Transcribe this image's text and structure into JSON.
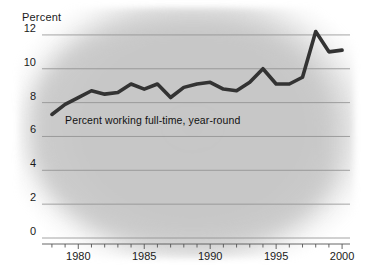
{
  "chart_data": {
    "type": "line",
    "title": "",
    "ylabel": "Percent",
    "xlabel": "",
    "ylim": [
      0,
      13
    ],
    "xlim": [
      1977.4,
      2000.6
    ],
    "grid": true,
    "legend_position": "inline-annotation",
    "annotations": [
      {
        "text": "Percent working full-time, year-round",
        "x": 1979.0,
        "y": 6.9
      }
    ],
    "y_ticks": [
      "0",
      "2",
      "4",
      "6",
      "8",
      "10",
      "12"
    ],
    "y_tick_values": [
      0,
      2,
      4,
      6,
      8,
      10,
      12
    ],
    "x_ticks": [
      "1980",
      "1985",
      "1990",
      "1995",
      "2000"
    ],
    "x_tick_values": [
      1980,
      1985,
      1990,
      1995,
      2000
    ],
    "x_minor_step": 1,
    "series": [
      {
        "name": "Percent working full-time, year-round",
        "color": "#333333",
        "x": [
          1978,
          1979,
          1980,
          1981,
          1982,
          1983,
          1984,
          1985,
          1986,
          1987,
          1988,
          1989,
          1990,
          1991,
          1992,
          1993,
          1994,
          1995,
          1996,
          1997,
          1998,
          1999,
          2000
        ],
        "values": [
          7.3,
          7.9,
          8.3,
          8.7,
          8.5,
          8.6,
          9.1,
          8.8,
          9.1,
          8.3,
          8.9,
          9.1,
          9.2,
          8.8,
          8.7,
          9.2,
          10.0,
          9.1,
          9.1,
          9.5,
          12.2,
          11.0,
          11.1
        ]
      }
    ]
  },
  "axes": {
    "y_axis_title": "Percent"
  },
  "colors": {
    "line": "#333333",
    "grid": "#8e8e8e",
    "axis": "#555555",
    "background_tint": "#c6c6c6",
    "text": "#1a1a1a"
  }
}
